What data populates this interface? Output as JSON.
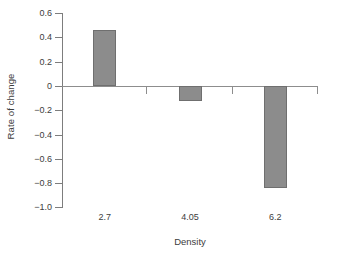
{
  "chart_data": {
    "type": "bar",
    "title": "",
    "subtitle": "",
    "xlabel": "Density",
    "ylabel": "Rate of change",
    "categories": [
      "2.7",
      "4.05",
      "6.2"
    ],
    "values": [
      0.465,
      -0.125,
      -0.84
    ],
    "series": [
      {
        "name": "Rate of change",
        "values": [
          0.465,
          -0.125,
          -0.84
        ]
      }
    ],
    "ylim": [
      -1.0,
      0.6
    ],
    "yticks": [
      0.6,
      0.4,
      0.2,
      0,
      -0.2,
      -0.4,
      -0.6,
      -0.8,
      -1.0
    ],
    "ytick_labels": [
      "0.6",
      "0.4",
      "0.2",
      "0",
      "−0.2",
      "−0.4",
      "−0.6",
      "−0.8",
      "−1.0"
    ],
    "grid": false,
    "legend": null,
    "legend_position": "none",
    "annotations": [],
    "colors": {
      "bar_fill": "#8c8c8c",
      "bar_border": "#6f6f6f",
      "axis": "#7d7d7d",
      "baseline": "#8d8d8d",
      "text": "#3d3d3d",
      "background": "#ffffff"
    }
  }
}
